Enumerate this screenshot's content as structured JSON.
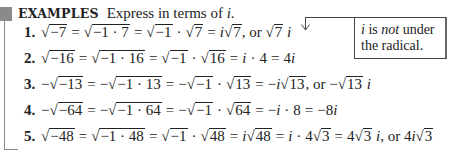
{
  "header": {
    "label": "EXAMPLES",
    "instruction_prefix": "Express in terms of ",
    "instruction_var": "i",
    "instruction_suffix": "."
  },
  "callout": {
    "line1_var": "i",
    "line1_mid": " is ",
    "line1_emph": "not",
    "line1_end": " under",
    "line2": "the radical."
  },
  "examples": [
    {
      "number": "1.",
      "text": "√−7 = √−1 · 7 = √−1 · √7 = i√7, or √7 i"
    },
    {
      "number": "2.",
      "text": "√−16 = √−1 · 16 = √−1 · √16 = i · 4 = 4i"
    },
    {
      "number": "3.",
      "text": "−√−13 = −√−1 · 13 = −√−1 · √13 = −i√13, or −√13 i"
    },
    {
      "number": "4.",
      "text": "−√−64 = −√−1 · 64 = −√−1 · √64 = −i · 8 = −8i"
    },
    {
      "number": "5.",
      "text": "√−48 = √−1 · 48 = √−1 · √48 = i√48 = i · 4√3 = 4√3 i, or 4i√3"
    }
  ],
  "tokens": {
    "sqrt": "√",
    "eq": "=",
    "dot": "·",
    "minus": "−",
    "i": "i",
    "or": ", or",
    "r1": {
      "a": "−7",
      "b": "−1 · 7",
      "c": "−1",
      "d": "7",
      "e": "7",
      "f": "7"
    },
    "r2": {
      "a": "−16",
      "b": "−1 · 16",
      "c": "−1",
      "d": "16",
      "e": "4",
      "f": "4"
    },
    "r3": {
      "a": "−13",
      "b": "−1 · 13",
      "c": "−1",
      "d": "13",
      "e": "13",
      "f": "13"
    },
    "r4": {
      "a": "−64",
      "b": "−1 · 64",
      "c": "−1",
      "d": "64",
      "e": "8",
      "f": "−8"
    },
    "r5": {
      "a": "−48",
      "b": "−1 · 48",
      "c": "−1",
      "d": "48",
      "e": "48",
      "f": "4",
      "g": "3",
      "h": "4",
      "k": "3",
      "m": "4",
      "n": "3"
    }
  }
}
